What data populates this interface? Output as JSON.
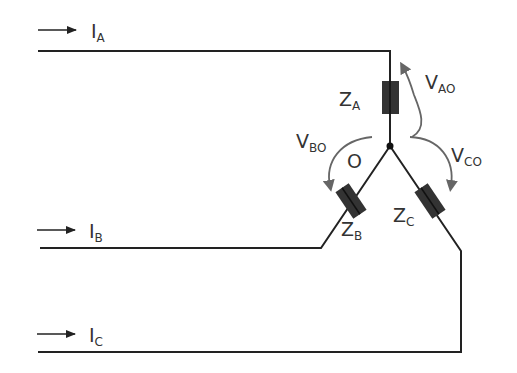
{
  "diagram": {
    "colors": {
      "wire": "#222222",
      "impedance": "#333333",
      "voltage_arrow": "#666666",
      "text": "#333333"
    },
    "currents": [
      {
        "id": "A",
        "symbol": "I",
        "subscript": "A"
      },
      {
        "id": "B",
        "symbol": "I",
        "subscript": "B"
      },
      {
        "id": "C",
        "symbol": "I",
        "subscript": "C"
      }
    ],
    "impedances": [
      {
        "id": "A",
        "symbol": "Z",
        "subscript": "A"
      },
      {
        "id": "B",
        "symbol": "Z",
        "subscript": "B"
      },
      {
        "id": "C",
        "symbol": "Z",
        "subscript": "C"
      }
    ],
    "voltages": [
      {
        "id": "AO",
        "symbol": "V",
        "subscript": "AO"
      },
      {
        "id": "BO",
        "symbol": "V",
        "subscript": "BO"
      },
      {
        "id": "CO",
        "symbol": "V",
        "subscript": "CO"
      }
    ],
    "neutral": {
      "label": "O"
    }
  }
}
